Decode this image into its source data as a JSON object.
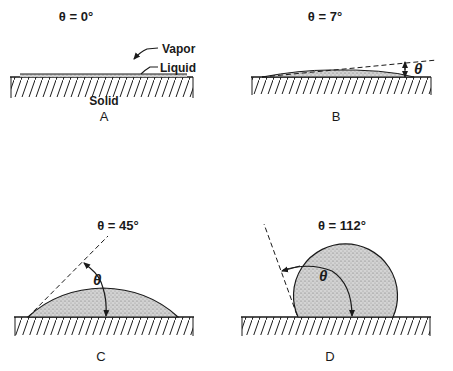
{
  "figure": {
    "panels": [
      {
        "id": "A",
        "title": "θ = 0°",
        "angle_deg": 0,
        "letter": "A",
        "labels": {
          "vapor": "Vapor",
          "liquid": "Liquid",
          "solid": "Solid"
        }
      },
      {
        "id": "B",
        "title": "θ = 7°",
        "angle_deg": 7,
        "letter": "B",
        "angle_symbol": "θ"
      },
      {
        "id": "C",
        "title": "θ = 45°",
        "angle_deg": 45,
        "letter": "C",
        "angle_symbol": "θ"
      },
      {
        "id": "D",
        "title": "θ = 112°",
        "angle_deg": 112,
        "letter": "D",
        "angle_symbol": "θ"
      }
    ]
  },
  "colors": {
    "ink": "#1a1a1a",
    "stipple_fill": "#c9c9c9",
    "background": "#ffffff"
  }
}
